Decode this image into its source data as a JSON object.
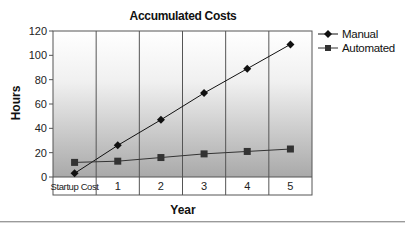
{
  "chart_data": {
    "type": "line",
    "title": "Accumulated Costs",
    "xlabel": "Year",
    "ylabel": "Hours",
    "categories": [
      "Startup Cost",
      "1",
      "2",
      "3",
      "4",
      "5"
    ],
    "series": [
      {
        "name": "Manual",
        "marker": "diamond",
        "color": "#111111",
        "values": [
          3,
          26,
          47,
          69,
          89,
          109
        ]
      },
      {
        "name": "Automated",
        "marker": "square",
        "color": "#333333",
        "values": [
          12,
          13,
          16,
          19,
          21,
          23
        ]
      }
    ],
    "ylim": [
      0,
      120
    ],
    "yticks": [
      0,
      20,
      40,
      60,
      80,
      100,
      120
    ],
    "grid": "vertical category dividers",
    "legend_position": "right",
    "background": "vertical gradient white to gray"
  },
  "labels": {
    "title": "Accumulated Costs",
    "xlabel": "Year",
    "ylabel": "Hours",
    "legend": [
      "Manual",
      "Automated"
    ]
  }
}
